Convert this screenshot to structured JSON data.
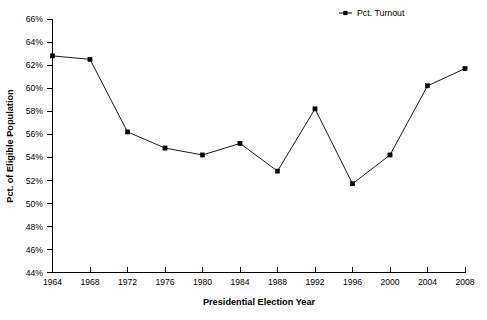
{
  "chart_data": {
    "type": "line",
    "title": "",
    "xlabel": "Presidential Election Year",
    "ylabel": "Pct. of Eligible Population",
    "x": [
      1964,
      1968,
      1972,
      1976,
      1980,
      1984,
      1988,
      1992,
      1996,
      2000,
      2004,
      2008
    ],
    "categories": [
      "1964",
      "1968",
      "1972",
      "1976",
      "1980",
      "1984",
      "1988",
      "1992",
      "1996",
      "2000",
      "2004",
      "2008"
    ],
    "series": [
      {
        "name": "Pct. Turnout",
        "values": [
          62.8,
          62.5,
          56.2,
          54.8,
          54.2,
          55.2,
          52.8,
          58.2,
          51.7,
          54.2,
          60.2,
          61.7
        ],
        "color": "#000000",
        "marker": "square"
      }
    ],
    "xlim": [
      1964,
      2008
    ],
    "ylim": [
      44,
      66
    ],
    "ytick_step": 2,
    "ytick_labels": [
      "44%",
      "46%",
      "48%",
      "50%",
      "52%",
      "54%",
      "56%",
      "58%",
      "60%",
      "62%",
      "64%",
      "66%"
    ],
    "ytick_values": [
      44,
      46,
      48,
      50,
      52,
      54,
      56,
      58,
      60,
      62,
      64,
      66
    ],
    "xtick_labels": [
      "1964",
      "1968",
      "1972",
      "1976",
      "1980",
      "1984",
      "1988",
      "1992",
      "1996",
      "2000",
      "2004",
      "2008"
    ],
    "grid": false,
    "legend_position": "top-right",
    "legend_entries": [
      "Pct. Turnout"
    ],
    "background": "#ffffff"
  },
  "legend": {
    "entry_label": "Pct. Turnout"
  },
  "axes": {
    "x_title": "Presidential Election Year",
    "y_title": "Pct. of Eligible Population"
  }
}
